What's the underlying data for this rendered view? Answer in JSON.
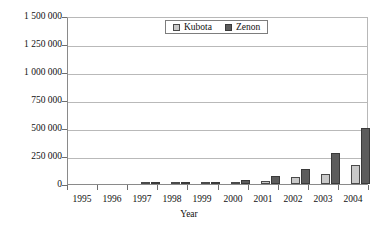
{
  "chart_data": {
    "type": "bar",
    "title": "",
    "xlabel": "Year",
    "ylabel": "",
    "categories": [
      "1995",
      "1996",
      "1997",
      "1998",
      "1999",
      "2000",
      "2001",
      "2002",
      "2003",
      "2004"
    ],
    "series": [
      {
        "name": "Kubota",
        "color": "#c9c9c9",
        "values": [
          2000,
          3000,
          5000,
          15000,
          25000,
          65000,
          90000,
          170000,
          240000,
          390000
        ]
      },
      {
        "name": "Zenon",
        "color": "#5c5c5c",
        "values": [
          2000,
          4000,
          6000,
          35000,
          75000,
          130000,
          280000,
          500000,
          750000,
          1450000
        ]
      }
    ],
    "ylim": [
      0,
      1500000
    ],
    "ytick_values": [
      0,
      250000,
      500000,
      750000,
      1000000,
      1250000,
      1500000
    ],
    "ytick_labels": [
      "0",
      "250 000",
      "500 000",
      "750 000",
      "1 000 000",
      "1 250 000",
      "1 500 000"
    ],
    "grid": true,
    "legend_position": "top-center",
    "legend_entries": [
      "Kubota",
      "Zenon"
    ]
  }
}
